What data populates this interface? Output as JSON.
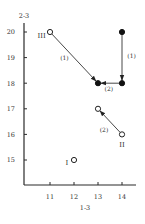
{
  "chart_data": {
    "type": "scatter",
    "title": "",
    "xlabel": "1-3",
    "ylabel": "2-3",
    "xlim": [
      10.0,
      14.6
    ],
    "ylim": [
      14.0,
      20.4
    ],
    "xticks": [
      11,
      12,
      13,
      14
    ],
    "yticks": [
      15,
      16,
      17,
      18,
      19,
      20
    ],
    "grid": false,
    "legend": null,
    "series": [
      {
        "name": "open",
        "marker": "open-circle",
        "points": [
          {
            "x": 11,
            "y": 20,
            "label": "III"
          },
          {
            "x": 14,
            "y": 16,
            "label": "II"
          },
          {
            "x": 13,
            "y": 17,
            "label": ""
          },
          {
            "x": 12,
            "y": 15,
            "label": "I"
          }
        ]
      },
      {
        "name": "filled",
        "marker": "filled-circle",
        "points": [
          {
            "x": 14,
            "y": 20,
            "label": ""
          },
          {
            "x": 14,
            "y": 18,
            "label": ""
          },
          {
            "x": 13,
            "y": 18,
            "label": ""
          }
        ]
      }
    ],
    "arrows": [
      {
        "from": [
          11,
          20
        ],
        "to": [
          13,
          18
        ],
        "label": "(1)",
        "label_pos": [
          11.6,
          18.9
        ]
      },
      {
        "from": [
          14,
          20
        ],
        "to": [
          14,
          18
        ],
        "label": "(1)",
        "label_pos": [
          14.4,
          19.0
        ]
      },
      {
        "from": [
          14,
          18
        ],
        "to": [
          13,
          18
        ],
        "label": "(2)",
        "label_pos": [
          13.45,
          17.7
        ]
      },
      {
        "from": [
          14,
          16
        ],
        "to": [
          13,
          17
        ],
        "label": "(2)",
        "label_pos": [
          13.25,
          16.1
        ]
      }
    ],
    "region_labels": [
      {
        "text": "III",
        "x": 10.65,
        "y": 19.78
      },
      {
        "text": "II",
        "x": 14.0,
        "y": 15.5
      },
      {
        "text": "I",
        "x": 11.7,
        "y": 14.8
      }
    ]
  }
}
